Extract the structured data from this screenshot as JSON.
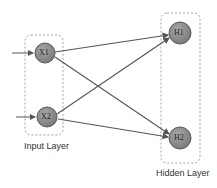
{
  "diagram": {
    "layers": [
      {
        "name": "Input Layer",
        "nodes": [
          "X1",
          "X2"
        ]
      },
      {
        "name": "Hidden Layer",
        "nodes": [
          "H1",
          "H2"
        ]
      }
    ],
    "edges": [
      {
        "from": "X1",
        "to": "H1"
      },
      {
        "from": "X1",
        "to": "H2"
      },
      {
        "from": "X2",
        "to": "H1"
      },
      {
        "from": "X2",
        "to": "H2"
      }
    ],
    "colors": {
      "node_fill": "#8a8a8a",
      "node_stroke": "#5a5a5a",
      "edge": "#555555",
      "box": "#888888"
    }
  }
}
